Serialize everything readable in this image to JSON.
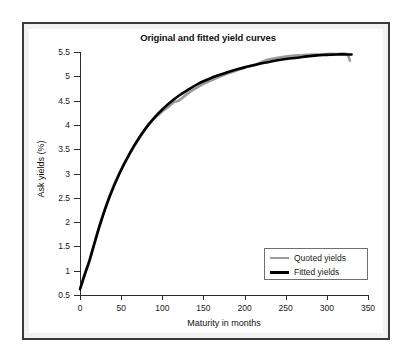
{
  "chart_data": {
    "type": "line",
    "title": "Original and fitted yield curves",
    "xlabel": "Maturity in months",
    "ylabel": "Ask yields (%)",
    "xlim": [
      0,
      350
    ],
    "ylim": [
      0.5,
      5.5
    ],
    "xticks": [
      0,
      50,
      100,
      150,
      200,
      250,
      300,
      350
    ],
    "yticks": [
      0.5,
      1,
      1.5,
      2,
      2.5,
      3,
      3.5,
      4,
      4.5,
      5,
      5.5
    ],
    "grid": false,
    "legend_position": "lower right",
    "legend": [
      "Quoted yields",
      "Fitted yields"
    ],
    "series": [
      {
        "name": "Quoted yields",
        "color": "#9a9a9a",
        "x": [
          1,
          6,
          12,
          24,
          36,
          48,
          60,
          72,
          84,
          96,
          108,
          114,
          120,
          132,
          144,
          156,
          168,
          180,
          192,
          204,
          216,
          228,
          240,
          252,
          264,
          276,
          288,
          300,
          312,
          324,
          328
        ],
        "y": [
          0.66,
          0.92,
          1.22,
          1.95,
          2.55,
          3.02,
          3.4,
          3.72,
          4.02,
          4.22,
          4.38,
          4.47,
          4.5,
          4.66,
          4.79,
          4.89,
          4.98,
          5.06,
          5.13,
          5.2,
          5.26,
          5.34,
          5.38,
          5.41,
          5.43,
          5.44,
          5.45,
          5.46,
          5.46,
          5.46,
          5.32
        ]
      },
      {
        "name": "Fitted yields",
        "color": "#000000",
        "x": [
          0,
          6,
          12,
          24,
          36,
          48,
          60,
          72,
          84,
          96,
          108,
          120,
          132,
          144,
          156,
          168,
          180,
          192,
          204,
          216,
          228,
          240,
          252,
          264,
          276,
          288,
          300,
          312,
          324,
          330
        ],
        "y": [
          0.62,
          0.94,
          1.24,
          1.93,
          2.52,
          3.0,
          3.4,
          3.74,
          4.02,
          4.25,
          4.44,
          4.6,
          4.73,
          4.85,
          4.94,
          5.02,
          5.09,
          5.15,
          5.2,
          5.25,
          5.29,
          5.33,
          5.36,
          5.38,
          5.41,
          5.43,
          5.44,
          5.45,
          5.45,
          5.45
        ]
      }
    ]
  },
  "legend": {
    "quoted_label": "Quoted yields",
    "fitted_label": "Fitted yields"
  },
  "colors": {
    "quoted": "#9a9a9a",
    "fitted": "#000000",
    "axis": "#2b2b2b",
    "frame_border": "#3a3a3a",
    "frame_fill": "#f2f2f2",
    "plot_background": "#ffffff"
  }
}
